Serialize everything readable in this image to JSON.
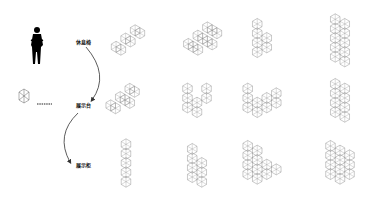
{
  "labels": {
    "rest_chair": "休息椅",
    "display_table": "展示台",
    "display_cabinet": "展示柜"
  },
  "legend": {
    "unit_icon": "hexagonal-cell-icon",
    "connector": "dotted-line"
  },
  "colors": {
    "line": "#888888",
    "figure": "#000000",
    "arrow": "#333333"
  },
  "grid": {
    "rows": 3,
    "cols": 4,
    "shapes": [
      {
        "row": 0,
        "col": 0,
        "cx": 128,
        "cy": 40,
        "cells": [
          [
            0,
            0
          ],
          [
            1,
            0
          ],
          [
            2,
            0
          ],
          [
            0,
            1
          ],
          [
            1,
            1
          ],
          [
            2,
            1
          ]
        ],
        "orient": "diag"
      },
      {
        "row": 0,
        "col": 1,
        "cx": 205,
        "cy": 40,
        "cells": [
          [
            0,
            0
          ],
          [
            1,
            0
          ],
          [
            2,
            0
          ],
          [
            0,
            1
          ],
          [
            1,
            1
          ],
          [
            2,
            1
          ],
          [
            0,
            2
          ],
          [
            1,
            2
          ],
          [
            2,
            2
          ],
          [
            1,
            3
          ]
        ],
        "orient": "diag"
      },
      {
        "row": 0,
        "col": 2,
        "cx": 262,
        "cy": 38,
        "cells": [
          [
            0,
            0
          ],
          [
            0,
            1
          ],
          [
            0,
            2
          ],
          [
            0,
            3
          ],
          [
            1,
            1
          ],
          [
            1,
            2
          ]
        ],
        "orient": "v"
      },
      {
        "row": 0,
        "col": 3,
        "cx": 340,
        "cy": 38,
        "cells": [
          [
            0,
            0
          ],
          [
            0,
            1
          ],
          [
            0,
            2
          ],
          [
            0,
            3
          ],
          [
            0,
            4
          ],
          [
            1,
            0
          ],
          [
            1,
            1
          ],
          [
            1,
            2
          ],
          [
            1,
            3
          ],
          [
            1,
            4
          ]
        ],
        "orient": "v"
      },
      {
        "row": 1,
        "col": 0,
        "cx": 125,
        "cy": 100,
        "cells": [
          [
            0,
            0
          ],
          [
            1,
            0
          ],
          [
            2,
            0
          ],
          [
            0,
            1
          ],
          [
            1,
            1
          ],
          [
            2,
            1
          ],
          [
            1,
            2
          ]
        ],
        "orient": "diag"
      },
      {
        "row": 1,
        "col": 1,
        "cx": 197,
        "cy": 98,
        "cells": [
          [
            0,
            0
          ],
          [
            0,
            1
          ],
          [
            0,
            2
          ],
          [
            1,
            1
          ],
          [
            1,
            2
          ],
          [
            2,
            0
          ],
          [
            2,
            1
          ]
        ],
        "orient": "v"
      },
      {
        "row": 1,
        "col": 2,
        "cx": 262,
        "cy": 98,
        "cells": [
          [
            0,
            0
          ],
          [
            0,
            1
          ],
          [
            0,
            2
          ],
          [
            1,
            1
          ],
          [
            1,
            2
          ],
          [
            2,
            1
          ],
          [
            2,
            2
          ],
          [
            3,
            0
          ],
          [
            3,
            1
          ]
        ],
        "orient": "v"
      },
      {
        "row": 1,
        "col": 3,
        "cx": 340,
        "cy": 98,
        "cells": [
          [
            0,
            0
          ],
          [
            0,
            1
          ],
          [
            0,
            2
          ],
          [
            0,
            3
          ],
          [
            1,
            0
          ],
          [
            1,
            1
          ],
          [
            1,
            2
          ],
          [
            1,
            3
          ]
        ],
        "orient": "v"
      },
      {
        "row": 2,
        "col": 0,
        "cx": 126,
        "cy": 163,
        "cells": [
          [
            0,
            0
          ],
          [
            0,
            1
          ],
          [
            0,
            2
          ],
          [
            0,
            3
          ],
          [
            0,
            4
          ]
        ],
        "orient": "v"
      },
      {
        "row": 2,
        "col": 1,
        "cx": 197,
        "cy": 163,
        "cells": [
          [
            0,
            0
          ],
          [
            0,
            1
          ],
          [
            0,
            2
          ],
          [
            0,
            3
          ],
          [
            1,
            1
          ],
          [
            1,
            2
          ],
          [
            1,
            3
          ]
        ],
        "orient": "v"
      },
      {
        "row": 2,
        "col": 2,
        "cx": 262,
        "cy": 160,
        "cells": [
          [
            0,
            0
          ],
          [
            0,
            1
          ],
          [
            0,
            2
          ],
          [
            0,
            3
          ],
          [
            1,
            0
          ],
          [
            1,
            1
          ],
          [
            1,
            2
          ],
          [
            1,
            3
          ],
          [
            2,
            2
          ],
          [
            2,
            3
          ],
          [
            3,
            2
          ]
        ],
        "orient": "v"
      },
      {
        "row": 2,
        "col": 3,
        "cx": 340,
        "cy": 160,
        "cells": [
          [
            0,
            0
          ],
          [
            0,
            1
          ],
          [
            0,
            2
          ],
          [
            0,
            3
          ],
          [
            1,
            0
          ],
          [
            1,
            1
          ],
          [
            1,
            2
          ],
          [
            1,
            3
          ],
          [
            2,
            1
          ],
          [
            2,
            2
          ],
          [
            2,
            3
          ]
        ],
        "orient": "v"
      }
    ]
  }
}
